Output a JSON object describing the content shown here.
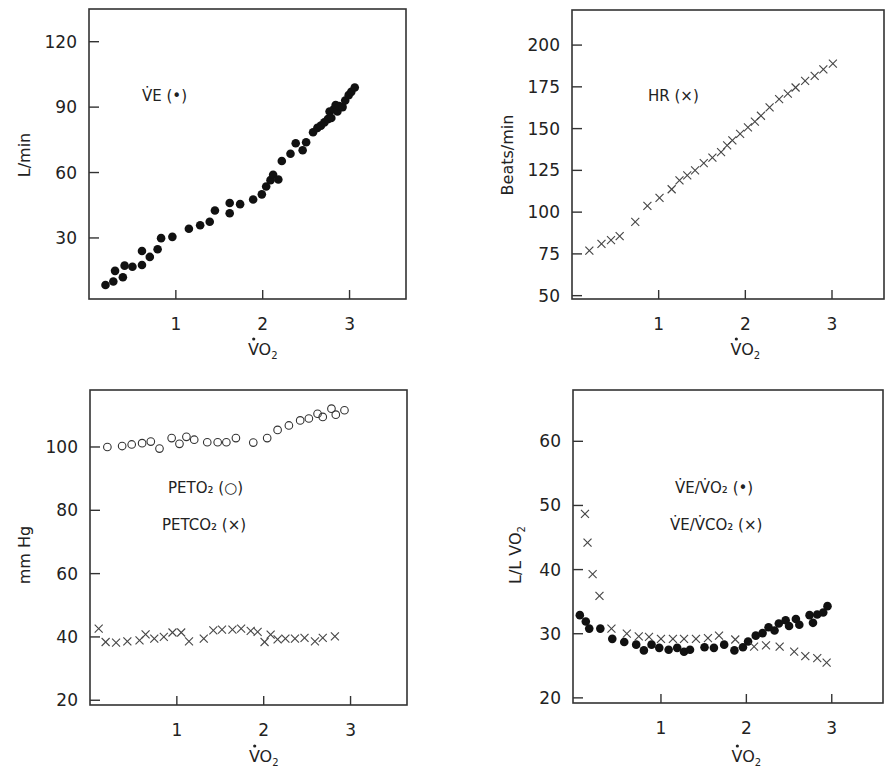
{
  "figure": {
    "panels": [
      {
        "id": "ve",
        "ylabel": "L/min",
        "xlabel": "VO2"
      },
      {
        "id": "hr",
        "ylabel": "Beats/min",
        "xlabel": "VO2"
      },
      {
        "id": "pet",
        "ylabel": "mm Hg",
        "xlabel": "VO2"
      },
      {
        "id": "ratio",
        "ylabel": "L/L VO2",
        "xlabel": "VO2"
      }
    ]
  },
  "chart_data": [
    {
      "type": "scatter",
      "title": "",
      "xlabel": "V̇O₂",
      "ylabel": "L/min",
      "xticks": [
        1,
        2,
        3
      ],
      "yticks": [
        30,
        60,
        90,
        120
      ],
      "xlim": [
        0,
        3.65
      ],
      "ylim": [
        2,
        135
      ],
      "grid": false,
      "legend": [
        {
          "label": "V̇E (•)",
          "marker": "dot",
          "position": "upper-left"
        }
      ],
      "series": [
        {
          "name": "V̇E",
          "marker": "dot",
          "points": [
            [
              0.19,
              8.4
            ],
            [
              0.28,
              10.0
            ],
            [
              0.3,
              14.9
            ],
            [
              0.39,
              12.0
            ],
            [
              0.41,
              17.3
            ],
            [
              0.5,
              16.8
            ],
            [
              0.61,
              17.6
            ],
            [
              0.61,
              24.0
            ],
            [
              0.7,
              21.3
            ],
            [
              0.79,
              24.8
            ],
            [
              0.83,
              29.9
            ],
            [
              0.96,
              30.5
            ],
            [
              1.15,
              34.2
            ],
            [
              1.28,
              35.8
            ],
            [
              1.39,
              37.4
            ],
            [
              1.45,
              42.6
            ],
            [
              1.62,
              41.3
            ],
            [
              1.62,
              46.0
            ],
            [
              1.74,
              45.5
            ],
            [
              1.89,
              47.6
            ],
            [
              1.99,
              50.0
            ],
            [
              2.04,
              53.6
            ],
            [
              2.09,
              56.5
            ],
            [
              2.12,
              59.0
            ],
            [
              2.18,
              56.8
            ],
            [
              2.22,
              65.3
            ],
            [
              2.32,
              68.6
            ],
            [
              2.38,
              73.4
            ],
            [
              2.46,
              70.2
            ],
            [
              2.5,
              73.9
            ],
            [
              2.58,
              78.5
            ],
            [
              2.63,
              80.5
            ],
            [
              2.67,
              81.5
            ],
            [
              2.71,
              83.0
            ],
            [
              2.75,
              84.5
            ],
            [
              2.77,
              88.0
            ],
            [
              2.79,
              85.0
            ],
            [
              2.82,
              89.0
            ],
            [
              2.84,
              91.0
            ],
            [
              2.86,
              88.0
            ],
            [
              2.88,
              90.5
            ],
            [
              2.92,
              90.0
            ],
            [
              2.95,
              93.0
            ],
            [
              2.99,
              95.5
            ],
            [
              3.02,
              97.0
            ],
            [
              3.06,
              99.0
            ]
          ]
        }
      ]
    },
    {
      "type": "scatter",
      "title": "",
      "xlabel": "V̇O₂",
      "ylabel": "Beats/min",
      "xticks": [
        1,
        2,
        3
      ],
      "yticks": [
        50,
        75,
        100,
        125,
        150,
        175,
        200
      ],
      "xlim": [
        0,
        3.6
      ],
      "ylim": [
        48,
        221
      ],
      "grid": false,
      "legend": [
        {
          "label": "HR (×)",
          "marker": "cross",
          "position": "upper-left"
        }
      ],
      "series": [
        {
          "name": "HR",
          "marker": "cross",
          "points": [
            [
              0.2,
              77.0
            ],
            [
              0.34,
              81.0
            ],
            [
              0.45,
              83.3
            ],
            [
              0.55,
              85.7
            ],
            [
              0.73,
              94.2
            ],
            [
              0.87,
              103.7
            ],
            [
              1.01,
              108.5
            ],
            [
              1.15,
              113.7
            ],
            [
              1.24,
              119.0
            ],
            [
              1.33,
              122.0
            ],
            [
              1.42,
              125.0
            ],
            [
              1.52,
              129.3
            ],
            [
              1.62,
              132.6
            ],
            [
              1.72,
              135.9
            ],
            [
              1.79,
              139.9
            ],
            [
              1.85,
              142.9
            ],
            [
              1.94,
              146.8
            ],
            [
              2.03,
              150.8
            ],
            [
              2.11,
              154.2
            ],
            [
              2.18,
              157.7
            ],
            [
              2.28,
              162.7
            ],
            [
              2.39,
              167.7
            ],
            [
              2.49,
              171.0
            ],
            [
              2.58,
              174.6
            ],
            [
              2.69,
              178.6
            ],
            [
              2.8,
              181.5
            ],
            [
              2.9,
              185.5
            ],
            [
              3.01,
              188.9
            ]
          ]
        }
      ]
    },
    {
      "type": "scatter",
      "title": "",
      "xlabel": "V̇O₂",
      "ylabel": "mm Hg",
      "xticks": [
        1,
        2,
        3
      ],
      "yticks": [
        20,
        40,
        60,
        80,
        100
      ],
      "xlim": [
        0,
        3.65
      ],
      "ylim": [
        18.5,
        118
      ],
      "grid": false,
      "legend": [
        {
          "label": "PETO₂ (○)",
          "marker": "circle",
          "position": "center"
        },
        {
          "label": "PETCO₂ (×)",
          "marker": "cross",
          "position": "center"
        }
      ],
      "series": [
        {
          "name": "PETO₂",
          "marker": "circle",
          "points": [
            [
              0.2,
              100.0
            ],
            [
              0.37,
              100.3
            ],
            [
              0.48,
              100.8
            ],
            [
              0.6,
              101.2
            ],
            [
              0.7,
              101.7
            ],
            [
              0.8,
              99.5
            ],
            [
              0.94,
              102.8
            ],
            [
              1.03,
              101.0
            ],
            [
              1.11,
              103.2
            ],
            [
              1.2,
              102.3
            ],
            [
              1.35,
              101.5
            ],
            [
              1.47,
              101.5
            ],
            [
              1.57,
              101.5
            ],
            [
              1.68,
              102.8
            ],
            [
              1.88,
              101.4
            ],
            [
              2.04,
              102.8
            ],
            [
              2.16,
              105.4
            ],
            [
              2.29,
              106.8
            ],
            [
              2.42,
              108.4
            ],
            [
              2.52,
              109.0
            ],
            [
              2.62,
              110.5
            ],
            [
              2.68,
              109.5
            ],
            [
              2.78,
              112.1
            ],
            [
              2.83,
              110.2
            ],
            [
              2.93,
              111.6
            ]
          ]
        },
        {
          "name": "PETCO₂",
          "marker": "cross",
          "points": [
            [
              0.1,
              42.6
            ],
            [
              0.18,
              38.4
            ],
            [
              0.3,
              38.2
            ],
            [
              0.43,
              38.6
            ],
            [
              0.57,
              38.9
            ],
            [
              0.64,
              40.8
            ],
            [
              0.74,
              39.5
            ],
            [
              0.85,
              40.0
            ],
            [
              0.95,
              41.4
            ],
            [
              1.05,
              41.4
            ],
            [
              1.14,
              38.6
            ],
            [
              1.31,
              39.5
            ],
            [
              1.42,
              42.1
            ],
            [
              1.52,
              42.3
            ],
            [
              1.64,
              42.3
            ],
            [
              1.74,
              42.6
            ],
            [
              1.85,
              41.9
            ],
            [
              1.93,
              41.6
            ],
            [
              2.01,
              38.4
            ],
            [
              2.08,
              40.7
            ],
            [
              2.16,
              39.2
            ],
            [
              2.25,
              39.5
            ],
            [
              2.36,
              39.5
            ],
            [
              2.47,
              39.7
            ],
            [
              2.59,
              38.6
            ],
            [
              2.68,
              39.7
            ],
            [
              2.82,
              40.2
            ]
          ]
        }
      ]
    },
    {
      "type": "scatter",
      "title": "",
      "xlabel": "V̇O₂",
      "ylabel": "L/L V̇O₂",
      "xticks": [
        1,
        2,
        3
      ],
      "yticks": [
        20,
        30,
        40,
        50,
        60
      ],
      "xlim": [
        -0.03,
        3.6
      ],
      "ylim": [
        19.2,
        68
      ],
      "grid": false,
      "legend": [
        {
          "label": "V̇E/V̇O₂ (•)",
          "marker": "dot",
          "position": "upper-right"
        },
        {
          "label": "V̇E/V̇CO₂ (×)",
          "marker": "cross",
          "position": "upper-right"
        }
      ],
      "series": [
        {
          "name": "V̇E/V̇O₂",
          "marker": "dot",
          "points": [
            [
              0.05,
              32.9
            ],
            [
              0.12,
              31.9
            ],
            [
              0.16,
              30.8
            ],
            [
              0.29,
              30.8
            ],
            [
              0.43,
              29.2
            ],
            [
              0.57,
              28.7
            ],
            [
              0.71,
              28.3
            ],
            [
              0.8,
              27.4
            ],
            [
              0.89,
              28.3
            ],
            [
              0.98,
              27.8
            ],
            [
              1.09,
              27.5
            ],
            [
              1.19,
              27.8
            ],
            [
              1.27,
              27.2
            ],
            [
              1.34,
              27.5
            ],
            [
              1.51,
              27.9
            ],
            [
              1.62,
              27.8
            ],
            [
              1.74,
              28.3
            ],
            [
              1.86,
              27.4
            ],
            [
              1.96,
              27.9
            ],
            [
              2.02,
              28.8
            ],
            [
              2.11,
              29.7
            ],
            [
              2.19,
              30.1
            ],
            [
              2.26,
              31.0
            ],
            [
              2.33,
              30.5
            ],
            [
              2.38,
              31.6
            ],
            [
              2.46,
              32.1
            ],
            [
              2.5,
              31.2
            ],
            [
              2.58,
              32.3
            ],
            [
              2.62,
              31.4
            ],
            [
              2.74,
              32.9
            ],
            [
              2.78,
              31.7
            ],
            [
              2.83,
              33.0
            ],
            [
              2.9,
              33.3
            ],
            [
              2.95,
              34.3
            ]
          ]
        },
        {
          "name": "V̇E/V̇CO₂",
          "marker": "cross",
          "points": [
            [
              0.11,
              48.7
            ],
            [
              0.14,
              44.2
            ],
            [
              0.2,
              39.3
            ],
            [
              0.28,
              35.9
            ],
            [
              0.42,
              30.8
            ],
            [
              0.6,
              30.0
            ],
            [
              0.74,
              29.6
            ],
            [
              0.86,
              29.5
            ],
            [
              1.0,
              29.2
            ],
            [
              1.14,
              29.2
            ],
            [
              1.27,
              29.2
            ],
            [
              1.41,
              29.2
            ],
            [
              1.55,
              29.3
            ],
            [
              1.68,
              29.7
            ],
            [
              1.87,
              29.1
            ],
            [
              2.09,
              28.0
            ],
            [
              2.23,
              28.2
            ],
            [
              2.39,
              28.0
            ],
            [
              2.56,
              27.2
            ],
            [
              2.69,
              26.5
            ],
            [
              2.83,
              26.2
            ],
            [
              2.94,
              25.5
            ]
          ]
        }
      ]
    }
  ]
}
